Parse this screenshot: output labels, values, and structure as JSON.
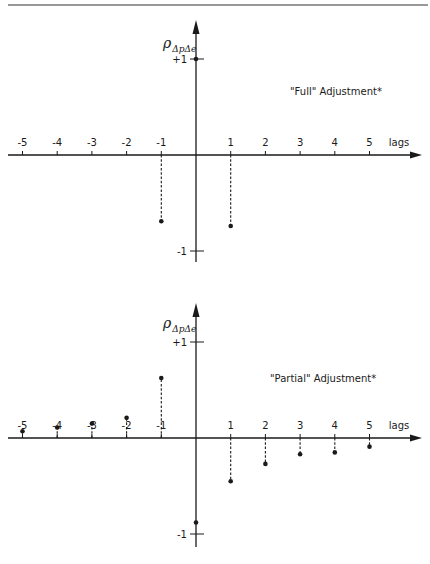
{
  "figure": {
    "top_rule": true
  },
  "chart_data": [
    {
      "type": "stem",
      "title": "\"Full\" Adjustment*",
      "ylabel": "ρ",
      "ylabel_subscript": "ΔpΔe",
      "xlabel": "lags",
      "x_tick_labels": [
        "-5",
        "-4",
        "-3",
        "-2",
        "-1",
        "1",
        "2",
        "3",
        "4",
        "5"
      ],
      "y_tick_labels": [
        "+1",
        "-1"
      ],
      "ylim": [
        -1,
        1
      ],
      "xlim": [
        -5,
        5
      ],
      "grid": false,
      "legend": "none",
      "points": [
        {
          "lag": -1,
          "value": -0.69
        },
        {
          "lag": 0,
          "value": 1.0
        },
        {
          "lag": 1,
          "value": -0.74
        }
      ]
    },
    {
      "type": "stem",
      "title": "\"Partial\" Adjustment*",
      "ylabel": "ρ",
      "ylabel_subscript": "ΔpΔe",
      "xlabel": "lags",
      "x_tick_labels": [
        "-5",
        "-4",
        "-3",
        "-2",
        "-1",
        "1",
        "2",
        "3",
        "4",
        "5"
      ],
      "y_tick_labels": [
        "+1",
        "-1"
      ],
      "ylim": [
        -1,
        1
      ],
      "xlim": [
        -5,
        5
      ],
      "grid": false,
      "legend": "none",
      "points": [
        {
          "lag": -5,
          "value": 0.07
        },
        {
          "lag": -4,
          "value": 0.11
        },
        {
          "lag": -3,
          "value": 0.15
        },
        {
          "lag": -2,
          "value": 0.21
        },
        {
          "lag": -1,
          "value": 0.625
        },
        {
          "lag": 0,
          "value": -0.88
        },
        {
          "lag": 1,
          "value": -0.45
        },
        {
          "lag": 2,
          "value": -0.27
        },
        {
          "lag": 3,
          "value": -0.17
        },
        {
          "lag": 4,
          "value": -0.15
        },
        {
          "lag": 5,
          "value": -0.09
        }
      ]
    }
  ]
}
